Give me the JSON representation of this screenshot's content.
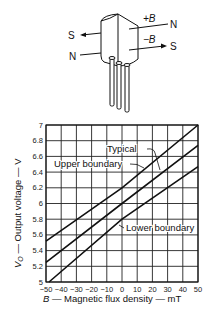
{
  "diagram": {
    "labels": {
      "plus_b": "+B",
      "minus_b": "−B",
      "n_top": "N",
      "s_right": "S",
      "s_left": "S",
      "n_left": "N"
    }
  },
  "chart_data": {
    "type": "line",
    "title": "",
    "xlabel": "B — Magnetic flux density — mT",
    "ylabel": "Vₒ — Output voltage — V",
    "xlabel_parts": {
      "var": "B",
      "rest": " — Magnetic flux density — mT"
    },
    "ylabel_parts": {
      "var": "V",
      "sub": "O",
      "rest": " — Output voltage — V"
    },
    "xlim": [
      -50,
      50
    ],
    "ylim": [
      5,
      7
    ],
    "grid": true,
    "x_ticks": [
      -50,
      -40,
      -30,
      -20,
      -10,
      0,
      10,
      20,
      30,
      40,
      50
    ],
    "x_tick_labels": [
      "−50",
      "−40",
      "−30",
      "−20",
      "−10",
      "0",
      "10",
      "20",
      "30",
      "40",
      "50"
    ],
    "y_ticks": [
      5,
      5.2,
      5.4,
      5.6,
      5.8,
      6,
      6.2,
      6.4,
      6.6,
      6.8,
      7
    ],
    "y_tick_labels": [
      "5",
      "5.2",
      "5.4",
      "5.6",
      "5.8",
      "6",
      "6.2",
      "6.4",
      "6.6",
      "6.8",
      "7"
    ],
    "series": [
      {
        "name": "Upper boundary",
        "x": [
          -50,
          0,
          50
        ],
        "values": [
          5.52,
          6.2,
          7.0
        ]
      },
      {
        "name": "Typical",
        "x": [
          -50,
          0,
          50
        ],
        "values": [
          5.25,
          6.0,
          6.74
        ]
      },
      {
        "name": "Lower boundary",
        "x": [
          -48,
          0,
          50
        ],
        "values": [
          5.0,
          5.8,
          6.47
        ]
      }
    ],
    "annotations": [
      "Typical",
      "Upper boundary",
      "Lower boundary"
    ]
  }
}
